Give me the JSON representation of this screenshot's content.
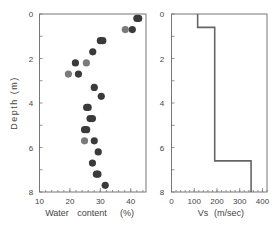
{
  "chart_data": [
    {
      "type": "scatter",
      "title": "",
      "xlabel": "Water content (%)",
      "xlabel_parts": [
        "Water",
        "content",
        "(%)"
      ],
      "ylabel": "Depth (m)",
      "xlim": [
        10,
        45
      ],
      "ylim": [
        8,
        0
      ],
      "xticks": [
        10,
        20,
        30,
        40
      ],
      "yticks": [
        0,
        2,
        4,
        6,
        8
      ],
      "grid": false,
      "series": [
        {
          "name": "dark",
          "color": "#3a3a3a",
          "points": [
            {
              "x": 42.0,
              "y": 0.2
            },
            {
              "x": 42.6,
              "y": 0.2
            },
            {
              "x": 40.5,
              "y": 0.7
            },
            {
              "x": 30.0,
              "y": 1.2
            },
            {
              "x": 30.8,
              "y": 1.2
            },
            {
              "x": 27.5,
              "y": 1.7
            },
            {
              "x": 21.8,
              "y": 2.2
            },
            {
              "x": 22.8,
              "y": 2.7
            },
            {
              "x": 28.0,
              "y": 3.3
            },
            {
              "x": 30.3,
              "y": 3.7
            },
            {
              "x": 25.5,
              "y": 4.2
            },
            {
              "x": 26.0,
              "y": 4.2
            },
            {
              "x": 26.6,
              "y": 4.7
            },
            {
              "x": 27.4,
              "y": 4.7
            },
            {
              "x": 24.8,
              "y": 5.2
            },
            {
              "x": 25.5,
              "y": 5.2
            },
            {
              "x": 28.0,
              "y": 5.7
            },
            {
              "x": 29.3,
              "y": 6.2
            },
            {
              "x": 27.4,
              "y": 6.7
            },
            {
              "x": 28.7,
              "y": 7.2
            },
            {
              "x": 29.2,
              "y": 7.2
            },
            {
              "x": 31.6,
              "y": 7.7
            }
          ]
        },
        {
          "name": "gray",
          "color": "#7a7a7a",
          "points": [
            {
              "x": 38.2,
              "y": 0.7
            },
            {
              "x": 25.4,
              "y": 2.2
            },
            {
              "x": 19.5,
              "y": 2.7
            },
            {
              "x": 24.8,
              "y": 5.7
            }
          ]
        }
      ]
    },
    {
      "type": "line",
      "title": "",
      "xlabel": "Vs (m/sec)",
      "xlabel_parts": [
        "Vs",
        "(m/sec)"
      ],
      "ylabel": "",
      "xlim": [
        0,
        420
      ],
      "ylim": [
        8,
        0
      ],
      "xticks": [
        0,
        100,
        200,
        300,
        400
      ],
      "yticks": [
        0,
        2,
        4,
        6,
        8
      ],
      "grid": false,
      "series": [
        {
          "name": "Vs profile",
          "color": "#666666",
          "layers": [
            {
              "top": 0.0,
              "bottom": 0.6,
              "vs": 115
            },
            {
              "top": 0.6,
              "bottom": 6.6,
              "vs": 190
            },
            {
              "top": 6.6,
              "bottom": 8.0,
              "vs": 350
            }
          ]
        }
      ]
    }
  ]
}
